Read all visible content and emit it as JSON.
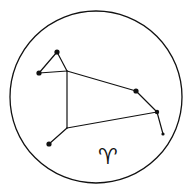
{
  "diagram": {
    "colors": {
      "ink": "#111111",
      "background": "#ffffff"
    },
    "border_circle": {
      "cx": 96,
      "cy": 97,
      "r": 86
    },
    "stars": [
      {
        "id": "A",
        "x": 57,
        "y": 52,
        "r": 2.6
      },
      {
        "id": "B",
        "x": 39,
        "y": 73,
        "r": 2.6
      },
      {
        "id": "D",
        "x": 136,
        "y": 91,
        "r": 2.6
      },
      {
        "id": "E",
        "x": 157,
        "y": 112,
        "r": 2.2
      },
      {
        "id": "F",
        "x": 163,
        "y": 134,
        "r": 1.6
      },
      {
        "id": "H",
        "x": 49,
        "y": 144,
        "r": 2.6
      }
    ],
    "joints": [
      {
        "id": "C",
        "x": 67,
        "y": 71
      },
      {
        "id": "G",
        "x": 67,
        "y": 128
      }
    ],
    "lines": [
      [
        "A",
        "B"
      ],
      [
        "A",
        "C"
      ],
      [
        "B",
        "C"
      ],
      [
        "C",
        "D"
      ],
      [
        "D",
        "E"
      ],
      [
        "E",
        "F"
      ],
      [
        "C",
        "G"
      ],
      [
        "G",
        "E"
      ],
      [
        "G",
        "H"
      ]
    ],
    "symbol": {
      "glyph": "♈",
      "name": "aries-symbol",
      "x": 98,
      "y": 146
    }
  }
}
